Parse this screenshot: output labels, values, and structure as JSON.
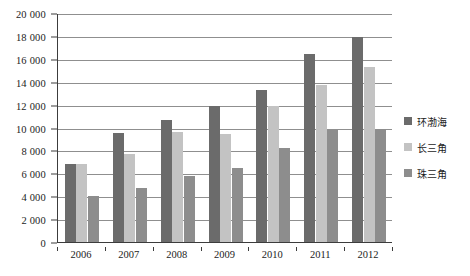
{
  "chart_data": {
    "type": "bar",
    "title": "",
    "xlabel": "",
    "ylabel": "",
    "categories": [
      "2006",
      "2007",
      "2008",
      "2009",
      "2010",
      "2011",
      "2012"
    ],
    "series": [
      {
        "name": "环渤海",
        "color": "#6b6b6b",
        "values": [
          6800,
          9500,
          10700,
          11900,
          13300,
          16400,
          17900
        ]
      },
      {
        "name": "长三角",
        "color": "#c3c3c3",
        "values": [
          6800,
          7700,
          9600,
          9400,
          11900,
          13700,
          15300
        ]
      },
      {
        "name": "珠三角",
        "color": "#8d8d8d",
        "values": [
          4000,
          4700,
          5800,
          6500,
          8200,
          9800,
          9900
        ]
      }
    ],
    "ylim": [
      0,
      20000
    ],
    "ytick_step": 2000,
    "ytick_labels": [
      "0",
      "2 000",
      "4 000",
      "6 000",
      "8 000",
      "10 000",
      "12 000",
      "14 000",
      "16 000",
      "18 000",
      "20 000"
    ],
    "ytick_values": [
      0,
      2000,
      4000,
      6000,
      8000,
      10000,
      12000,
      14000,
      16000,
      18000,
      20000
    ],
    "grid": true,
    "legend_position": "right"
  }
}
